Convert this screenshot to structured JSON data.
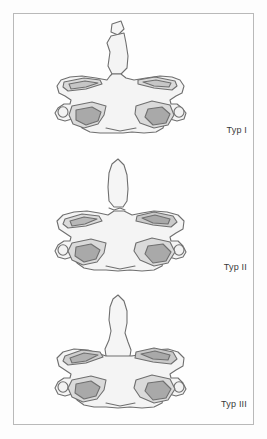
{
  "figure": {
    "panels": [
      {
        "id": "typ-1",
        "label": "Typ I",
        "fracture_level": "apex of dens",
        "dens_shape": "apex-avulsion"
      },
      {
        "id": "typ-2",
        "label": "Typ II",
        "fracture_level": "base of dens",
        "dens_shape": "pointed-dens-waist"
      },
      {
        "id": "typ-3",
        "label": "Typ III",
        "fracture_level": "extending into vertebral body",
        "dens_shape": "broad-base-jagged"
      }
    ]
  },
  "colors": {
    "frame_border": "#b9b9b9",
    "page_background": "#fdfdfd",
    "outline_stroke": "#6f6f6f",
    "body_fill": "#f4f4f4",
    "light_fill": "#dadada",
    "mid_fill": "#c6c6c6",
    "dark_fill": "#a9a9a9",
    "label_text": "#3a3a3a"
  }
}
